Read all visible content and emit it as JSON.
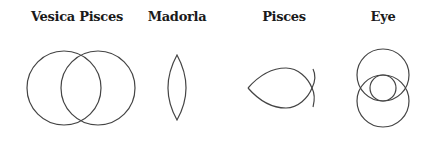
{
  "figures": [
    {
      "id": "vesica-pisces",
      "label": "Vesica Pisces",
      "label_x": 77
    },
    {
      "id": "madorla",
      "label": "Madorla",
      "label_x": 177
    },
    {
      "id": "pisces",
      "label": "Pisces",
      "label_x": 284
    },
    {
      "id": "eye",
      "label": "Eye",
      "label_x": 383
    }
  ],
  "colors": {
    "stroke": "#444444",
    "text": "#1a1a1a",
    "background": "#ffffff"
  }
}
